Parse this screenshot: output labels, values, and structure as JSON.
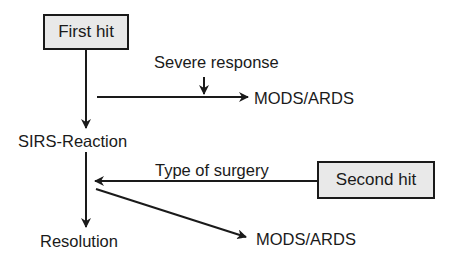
{
  "diagram": {
    "type": "flowchart",
    "nodes": {
      "first_hit": "First hit",
      "second_hit": "Second hit",
      "sirs": "SIRS-Reaction",
      "resolution": "Resolution",
      "mods_top": "MODS/ARDS",
      "mods_bottom": "MODS/ARDS"
    },
    "edge_labels": {
      "severe_response": "Severe response",
      "type_of_surgery": "Type of surgery"
    },
    "edges": [
      {
        "from": "First hit",
        "to": "SIRS-Reaction"
      },
      {
        "from": "First hit path",
        "to": "MODS/ARDS",
        "modifier": "Severe response"
      },
      {
        "from": "SIRS-Reaction",
        "to": "Resolution"
      },
      {
        "from": "Second hit",
        "to": "SIRS-Reaction path",
        "label": "Type of surgery"
      },
      {
        "from": "SIRS-Reaction path",
        "to": "MODS/ARDS"
      }
    ],
    "colors": {
      "box_fill": "#e9e9e9",
      "stroke": "#1a1a1a",
      "background": "#ffffff"
    }
  }
}
